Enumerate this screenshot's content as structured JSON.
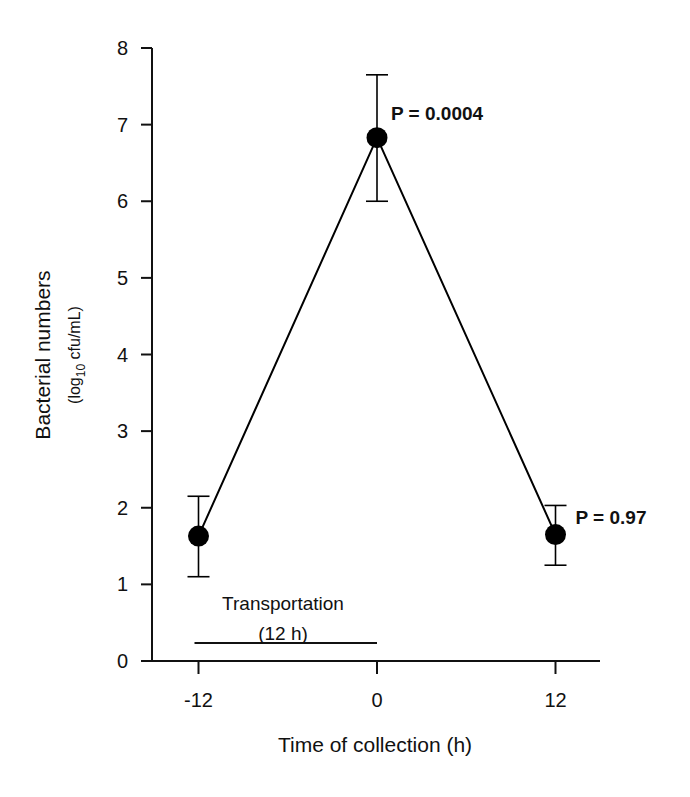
{
  "chart_data": {
    "type": "line",
    "title": "",
    "xlabel": "Time of collection (h)",
    "ylabel": "Bacterial numbers",
    "ylabel_sub": "(log10 cfu/mL)",
    "ylabel_sub_parts": {
      "pre": "(log",
      "sub": "10",
      "post": " cfu/mL)"
    },
    "x": [
      -12,
      0,
      12
    ],
    "series": [
      {
        "name": "Bacterial numbers",
        "values": [
          1.63,
          6.83,
          1.65
        ],
        "error_upper": [
          2.15,
          7.65,
          2.03
        ],
        "error_lower": [
          1.1,
          6.0,
          1.25
        ],
        "marker": "filled-circle",
        "color": "#000000"
      }
    ],
    "xticks": [
      -12,
      0,
      12
    ],
    "xtick_labels": [
      "-12",
      "0",
      "12"
    ],
    "yticks": [
      0,
      1,
      2,
      3,
      4,
      5,
      6,
      7,
      8
    ],
    "ytick_labels": [
      "0",
      "1",
      "2",
      "3",
      "4",
      "5",
      "6",
      "7",
      "8"
    ],
    "xlim": [
      -15,
      15
    ],
    "ylim": [
      0,
      8
    ],
    "grid": false,
    "legend": null,
    "annotations": [
      {
        "text": "P = 0.0004",
        "x": 0,
        "y": 7.3
      },
      {
        "text": "P = 0.97",
        "x": 12,
        "y": 2.0
      },
      {
        "text": "Transportation",
        "x": -6,
        "y": 0.85
      },
      {
        "text": "(12 h)",
        "x": -6,
        "y": 0.45
      }
    ],
    "span_bar": {
      "label": "Transportation (12 h)",
      "x_start": -12,
      "x_end": 0,
      "y": 0.22
    }
  }
}
